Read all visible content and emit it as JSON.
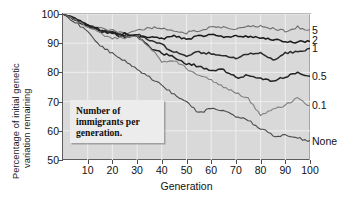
{
  "chart_data": {
    "type": "line",
    "title": "",
    "xlabel": "Generation",
    "ylabel_line1": "Percentage of initial genetic",
    "ylabel_line2": "variation remaining",
    "xlim": [
      0,
      100
    ],
    "ylim": [
      50,
      100
    ],
    "xticks": [
      10,
      20,
      30,
      40,
      50,
      60,
      70,
      80,
      90,
      100
    ],
    "yticks": [
      100,
      90,
      80,
      70,
      60,
      50
    ],
    "grid": true,
    "legend_position": "right-of-axes",
    "annotation": "Number of immigrants per generation.",
    "x": [
      0,
      5,
      10,
      15,
      20,
      25,
      30,
      35,
      40,
      45,
      50,
      55,
      60,
      65,
      70,
      75,
      80,
      85,
      90,
      95,
      100
    ],
    "series": [
      {
        "name": "5",
        "label": "5",
        "color": "#6e6e6e",
        "values": [
          100,
          98.2,
          96.3,
          95.0,
          94.6,
          93.3,
          94.1,
          95.4,
          95.0,
          94.2,
          93.6,
          94.3,
          95.5,
          95.3,
          95.0,
          95.6,
          96.0,
          95.1,
          94.2,
          95.6,
          94.2
        ]
      },
      {
        "name": "2",
        "label": "2",
        "color": "#1a1a1a",
        "values": [
          100,
          98.2,
          96.2,
          94.5,
          93.6,
          93.2,
          92.4,
          91.8,
          91.6,
          92.3,
          91.5,
          92.3,
          93.2,
          91.9,
          92.3,
          92.1,
          92.0,
          91.2,
          90.5,
          90.4,
          90.8
        ]
      },
      {
        "name": "1",
        "label": "1",
        "color": "#2b2b2b",
        "values": [
          100,
          98.1,
          96.0,
          94.6,
          93.4,
          92.6,
          93.3,
          91.0,
          89.5,
          86.9,
          85.8,
          86.9,
          86.5,
          85.6,
          84.9,
          86.3,
          86.8,
          84.0,
          86.7,
          87.0,
          88.2
        ]
      },
      {
        "name": "0.5",
        "label": "0.5",
        "color": "#232323",
        "values": [
          100,
          98.0,
          95.9,
          94.2,
          93.4,
          92.0,
          92.6,
          88.7,
          86.5,
          85.2,
          83.1,
          82.1,
          80.7,
          80.9,
          78.3,
          78.9,
          78.2,
          76.9,
          78.5,
          79.8,
          78.5
        ]
      },
      {
        "name": "0.1",
        "label": "0.1",
        "color": "#808080",
        "values": [
          100,
          97.8,
          95.6,
          93.4,
          91.6,
          91.9,
          92.4,
          88.9,
          83.8,
          84.1,
          81.4,
          79.0,
          77.5,
          75.0,
          73.2,
          71.0,
          65.5,
          67.3,
          68.8,
          71.3,
          68.5
        ]
      },
      {
        "name": "None",
        "label": "None",
        "color": "#4a4a4a",
        "values": [
          100,
          97.2,
          94.0,
          89.2,
          86.4,
          83.9,
          81.3,
          78.3,
          75.6,
          72.4,
          70.0,
          66.0,
          67.8,
          66.6,
          65.1,
          63.5,
          60.9,
          58.4,
          58.3,
          57.6,
          56.3
        ]
      }
    ]
  }
}
